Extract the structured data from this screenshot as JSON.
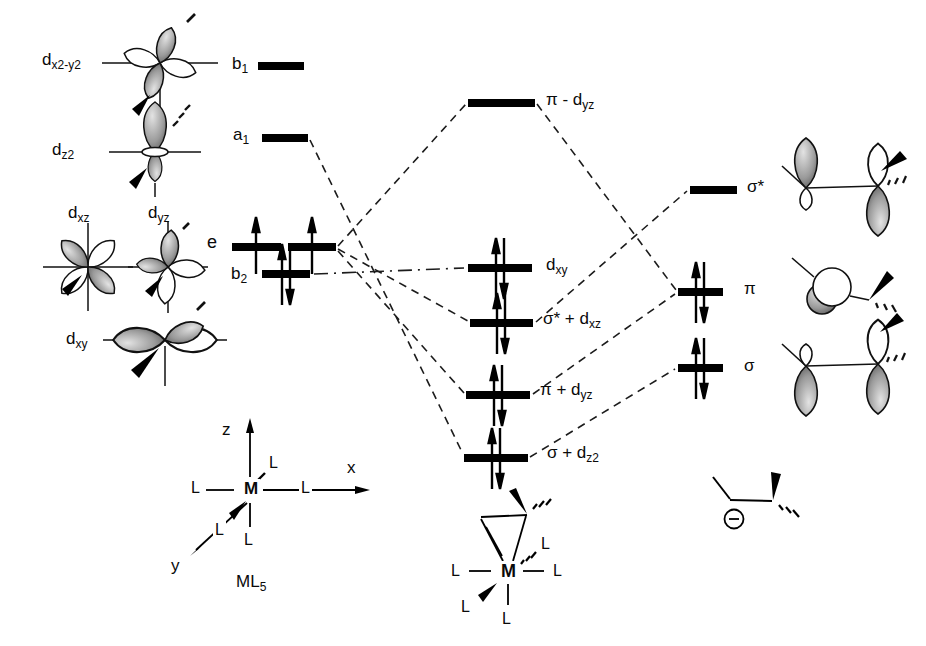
{
  "figure": {
    "type": "molecular orbital interaction diagram",
    "left_fragment_name": "ML5 metal fragment",
    "right_fragment_name": "carbanion ligand"
  },
  "left": {
    "dx2y2": {
      "pre": "d",
      "sub": "x2-y2"
    },
    "dz2": {
      "pre": "d",
      "sub": "z2"
    },
    "dxz": {
      "pre": "d",
      "sub": "xz"
    },
    "dyz": {
      "pre": "d",
      "sub": "yz"
    },
    "dxy": {
      "pre": "d",
      "sub": "xy"
    },
    "b1": {
      "pre": "b",
      "sub": "1"
    },
    "a1": {
      "pre": "a",
      "sub": "1"
    },
    "e": {
      "pre": "e",
      "sub": ""
    },
    "b2": {
      "pre": "b",
      "sub": "2"
    }
  },
  "center": {
    "pi_minus_dyz": {
      "pre": "π - d",
      "sub": "yz"
    },
    "dxy": {
      "pre": "d",
      "sub": "xy"
    },
    "sigma_star_plus_dxz": {
      "pre": "σ* + d",
      "sub": "xz"
    },
    "pi_plus_dyz": {
      "pre": "π + d",
      "sub": "yz"
    },
    "sigma_plus_dz2": {
      "pre": "σ + d",
      "sub": "z2"
    }
  },
  "right": {
    "sigma_star": "σ*",
    "pi": "π",
    "sigma": "σ"
  },
  "axes": {
    "x": "x",
    "y": "y",
    "z": "z"
  },
  "structures": {
    "metal": "M",
    "ligand": "L",
    "ml5": {
      "pre": "ML",
      "sub": "5"
    },
    "anion_charge": "−"
  },
  "diagram_data": {
    "type": "mo-correlation-diagram",
    "metal_fragment_levels": [
      {
        "label": "b1",
        "orbital": "dx2-y2",
        "electrons": 0
      },
      {
        "label": "a1",
        "orbital": "dz2",
        "electrons": 0
      },
      {
        "label": "e",
        "orbital": "dxz, dyz (degenerate)",
        "electrons": "2 (one up-spin in each bar)"
      },
      {
        "label": "b2",
        "orbital": "dxy",
        "electrons": 2
      }
    ],
    "ligand_levels": [
      {
        "label": "σ*",
        "electrons": 0
      },
      {
        "label": "π",
        "electrons": 2
      },
      {
        "label": "σ",
        "electrons": 2
      }
    ],
    "molecular_orbital_levels": [
      {
        "label": "π - dyz",
        "electrons": 0
      },
      {
        "label": "dxy",
        "electrons": 2
      },
      {
        "label": "σ* + dxz",
        "electrons": 2
      },
      {
        "label": "π + dyz",
        "electrons": 2
      },
      {
        "label": "σ + dz2",
        "electrons": 2
      }
    ],
    "correlation_lines": [
      [
        "a1",
        "σ + dz2"
      ],
      [
        "e",
        "π - dyz"
      ],
      [
        "e",
        "σ* + dxz"
      ],
      [
        "e",
        "π + dyz"
      ],
      [
        "b2",
        "dxy"
      ],
      [
        "π - dyz",
        "π"
      ],
      [
        "σ* + dxz",
        "σ*"
      ],
      [
        "π + dyz",
        "π"
      ],
      [
        "σ + dz2",
        "σ"
      ]
    ]
  },
  "colors": {
    "ink": "#000000",
    "background": "#ffffff",
    "lobe_shade": "#8f8f8f"
  }
}
